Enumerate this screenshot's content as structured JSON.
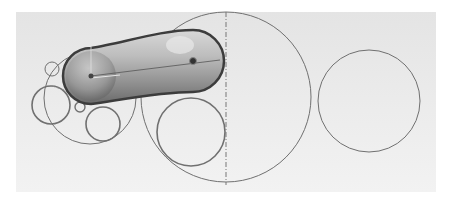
{
  "figure": {
    "colors": {
      "background": "#ffffff",
      "paper": "#e8e8e8",
      "line": "#6e6e6e",
      "arm_dark": "#5a5a5a",
      "arm_light": "#cfcfcf"
    },
    "elements": {
      "left_large_circle": {
        "cx": 90,
        "cy": 98,
        "r": 46
      },
      "left_small_top_circle": {
        "cx": 52,
        "cy": 69,
        "r": 7
      },
      "left_mid_circle": {
        "cx": 51,
        "cy": 105,
        "r": 19
      },
      "left_tiny_circle": {
        "cx": 80,
        "cy": 107,
        "r": 5
      },
      "left_bottom_circle": {
        "cx": 103,
        "cy": 124,
        "r": 17
      },
      "center_large_circle": {
        "cx": 226,
        "cy": 97,
        "r": 85
      },
      "center_inner_circle": {
        "cx": 191,
        "cy": 132,
        "r": 34
      },
      "right_circle": {
        "cx": 369,
        "cy": 101,
        "r": 51
      },
      "arm_pivot_left": {
        "cx": 91,
        "cy": 76
      },
      "arm_pivot_right": {
        "cx": 193,
        "cy": 61
      }
    }
  }
}
